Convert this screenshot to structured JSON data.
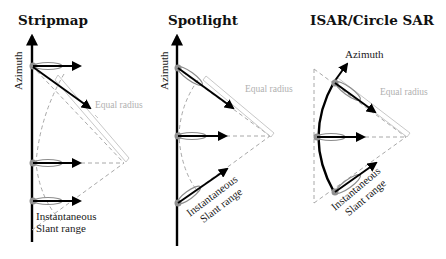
{
  "panels": [
    {
      "id": "stripmap",
      "title": "Stripmap",
      "azimuth_label": "Azimuth",
      "equal_radius_label": "Equal radius",
      "slant_label_line1": "Instantaneous",
      "slant_label_line2": "Slant range"
    },
    {
      "id": "spotlight",
      "title": "Spotlight",
      "azimuth_label": "Azimuth",
      "equal_radius_label": "Equal radius",
      "slant_label_line1": "Instantaneous",
      "slant_label_line2": "Slant range"
    },
    {
      "id": "isar-circle-sar",
      "title": "ISAR/Circle SAR",
      "azimuth_label": "Azimuth",
      "equal_radius_label": "Equal radius",
      "slant_label_line1": "Instantaneous",
      "slant_label_line2": "Slant range"
    }
  ],
  "colors": {
    "axis": "#000000",
    "dashed": "#a8a8a8",
    "beam": "#8c8c8c",
    "equal_radius_text": "#b0b0b0"
  }
}
